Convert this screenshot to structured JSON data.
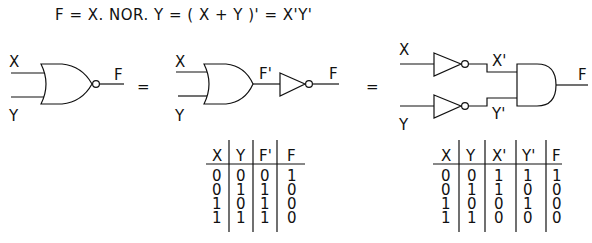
{
  "equation": "F = X. NOR. Y =  ( X + Y )' = X'Y'",
  "diagram1": {
    "inputs": [
      "X",
      "Y"
    ],
    "gate": "NOR",
    "output": "F"
  },
  "equals1": "=",
  "diagram2": {
    "inputs": [
      "X",
      "Y"
    ],
    "gate": "OR",
    "intermediate": "F'",
    "inverter_output": "F"
  },
  "equals2": "=",
  "diagram3": {
    "inputs": [
      "X",
      "Y"
    ],
    "inverted": [
      "X'",
      "Y'"
    ],
    "gate": "AND",
    "output": "F"
  },
  "table1": {
    "headers": [
      "X",
      "Y",
      "F'",
      "F"
    ],
    "rows": [
      [
        "0",
        "0",
        "0",
        "1"
      ],
      [
        "0",
        "1",
        "1",
        "0"
      ],
      [
        "1",
        "0",
        "1",
        "0"
      ],
      [
        "1",
        "1",
        "1",
        "0"
      ]
    ]
  },
  "table2": {
    "headers": [
      "X",
      "Y",
      "X'",
      "Y'",
      "F"
    ],
    "rows": [
      [
        "0",
        "0",
        "1",
        "1",
        "1"
      ],
      [
        "0",
        "1",
        "1",
        "0",
        "0"
      ],
      [
        "1",
        "0",
        "0",
        "1",
        "0"
      ],
      [
        "1",
        "1",
        "0",
        "0",
        "0"
      ]
    ]
  }
}
